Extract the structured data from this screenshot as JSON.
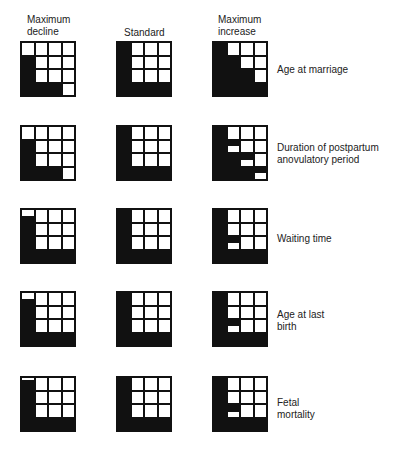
{
  "headers": {
    "decline": "Maximum\ndecline",
    "standard": "Standard",
    "increase": "Maximum\nincrease"
  },
  "rows": [
    {
      "label": "Age at marriage",
      "decline": [
        [
          0,
          0,
          0,
          0
        ],
        [
          1,
          0,
          0,
          0
        ],
        [
          1,
          0,
          0,
          0
        ],
        [
          1,
          1,
          1,
          0
        ]
      ],
      "standard": [
        [
          1,
          0,
          0,
          0
        ],
        [
          1,
          0,
          0,
          0
        ],
        [
          1,
          0,
          0,
          0
        ],
        [
          1,
          1,
          1,
          1
        ]
      ],
      "increase": [
        [
          1,
          0,
          0,
          0
        ],
        [
          1,
          1,
          0,
          0
        ],
        [
          1,
          1,
          1,
          0
        ],
        [
          1,
          1,
          1,
          1
        ]
      ]
    },
    {
      "label": "Duration of postpartum\nanovulatory period",
      "decline": [
        [
          0,
          0,
          0,
          0
        ],
        [
          1,
          0,
          0,
          0
        ],
        [
          1,
          0,
          0,
          0
        ],
        [
          1,
          1,
          1,
          0
        ]
      ],
      "standard": [
        [
          1,
          0,
          0,
          0
        ],
        [
          1,
          0,
          0,
          0
        ],
        [
          1,
          0,
          0,
          0
        ],
        [
          1,
          1,
          1,
          1
        ]
      ],
      "increase": [
        [
          1,
          0,
          0,
          0
        ],
        [
          1,
          0.5,
          0,
          0
        ],
        [
          1,
          1,
          0.5,
          0
        ],
        [
          1,
          1,
          1,
          0.5
        ]
      ]
    },
    {
      "label": "Waiting time",
      "decline": [
        [
          0.5,
          0,
          0,
          0
        ],
        [
          1,
          0,
          0,
          0
        ],
        [
          1,
          0,
          0,
          0
        ],
        [
          1,
          1,
          1,
          1
        ]
      ],
      "standard": [
        [
          1,
          0,
          0,
          0
        ],
        [
          1,
          0,
          0,
          0
        ],
        [
          1,
          0,
          0,
          0
        ],
        [
          1,
          1,
          1,
          1
        ]
      ],
      "increase": [
        [
          1,
          0,
          0,
          0
        ],
        [
          1,
          0,
          0,
          0
        ],
        [
          1,
          0.5,
          0,
          0
        ],
        [
          1,
          1,
          1,
          1
        ]
      ]
    },
    {
      "label": "Age at last\nbirth",
      "decline": [
        [
          0.5,
          0,
          0,
          0
        ],
        [
          1,
          0,
          0,
          0
        ],
        [
          1,
          0,
          0,
          0
        ],
        [
          1,
          1,
          1,
          1
        ]
      ],
      "standard": [
        [
          1,
          0,
          0,
          0
        ],
        [
          1,
          0,
          0,
          0
        ],
        [
          1,
          0,
          0,
          0
        ],
        [
          1,
          1,
          1,
          1
        ]
      ],
      "increase": [
        [
          1,
          0,
          0,
          0
        ],
        [
          1,
          0,
          0,
          0
        ],
        [
          1,
          0.5,
          0,
          0
        ],
        [
          1,
          1,
          1,
          1
        ]
      ]
    },
    {
      "label": "Fetal\nmortality",
      "decline": [
        [
          0.85,
          0,
          0,
          0
        ],
        [
          1,
          0,
          0,
          0
        ],
        [
          1,
          0,
          0,
          0
        ],
        [
          1,
          1,
          1,
          1
        ]
      ],
      "standard": [
        [
          1,
          0,
          0,
          0
        ],
        [
          1,
          0,
          0,
          0
        ],
        [
          1,
          0,
          0,
          0
        ],
        [
          1,
          1,
          1,
          1
        ]
      ],
      "increase": [
        [
          1,
          0,
          0,
          0
        ],
        [
          1,
          0,
          0,
          0
        ],
        [
          1,
          0.6,
          0,
          0
        ],
        [
          1,
          1,
          1,
          1
        ]
      ]
    }
  ]
}
